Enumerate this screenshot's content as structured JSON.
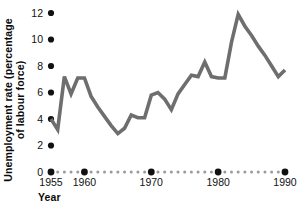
{
  "chart_data": {
    "type": "line",
    "title": "",
    "xlabel": "Year",
    "ylabel": "Unemployment rate (percentage of labour force)",
    "ylabel_line1": "Unemployment rate (percentage",
    "ylabel_line2": "of labour force)",
    "xlim": [
      1954,
      1990.5
    ],
    "ylim": [
      0,
      12.6
    ],
    "grid": false,
    "legend": null,
    "line_color": "#6e6e6e",
    "line_width": 3.6,
    "tick_color_major": "#111111",
    "tick_color_minor": "#9a9a9a",
    "y_ticks": [
      0,
      2,
      4,
      6,
      8,
      10,
      12
    ],
    "y_tick_labels": [
      "0",
      "2",
      "4",
      "6",
      "8",
      "10",
      "12"
    ],
    "x_ticks_major": [
      1955,
      1960,
      1970,
      1980,
      1990
    ],
    "x_tick_labels": [
      "1955",
      "1960",
      "1970",
      "1980",
      "1990"
    ],
    "x_ticks_minor": [
      1956,
      1957,
      1958,
      1959,
      1961,
      1962,
      1963,
      1964,
      1965,
      1966,
      1967,
      1968,
      1969,
      1971,
      1972,
      1973,
      1974,
      1975,
      1976,
      1977,
      1978,
      1979,
      1981,
      1982,
      1983,
      1984,
      1985,
      1986,
      1987,
      1988,
      1989
    ],
    "x": [
      1955,
      1956,
      1957,
      1958,
      1959,
      1960,
      1961,
      1962,
      1963,
      1964,
      1965,
      1966,
      1967,
      1968,
      1969,
      1970,
      1971,
      1972,
      1973,
      1974,
      1975,
      1976,
      1977,
      1978,
      1979,
      1980,
      1981,
      1982,
      1983,
      1984,
      1985,
      1986,
      1987,
      1988,
      1989,
      1990
    ],
    "values": [
      4.0,
      3.2,
      7.2,
      5.9,
      7.1,
      7.1,
      5.7,
      4.9,
      4.2,
      3.5,
      2.9,
      3.3,
      4.3,
      4.1,
      4.1,
      5.8,
      6.0,
      5.5,
      4.7,
      5.9,
      6.6,
      7.3,
      7.2,
      8.3,
      7.2,
      7.1,
      7.1,
      9.8,
      11.9,
      11.0,
      10.3,
      9.5,
      8.8,
      8.0,
      7.2,
      7.7
    ]
  }
}
